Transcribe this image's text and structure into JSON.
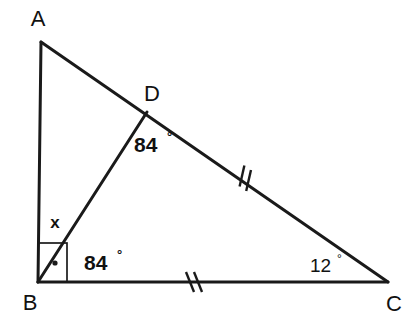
{
  "figure": {
    "type": "geometry-diagram",
    "shape": "triangle-with-cevian",
    "background_color": "#ffffff",
    "stroke_color": "#1a1a1a",
    "vertices": [
      {
        "id": "A",
        "label": "A",
        "x": 41,
        "y": 42,
        "label_x": 38,
        "label_y": 26
      },
      {
        "id": "B",
        "label": "B",
        "x": 38,
        "y": 282,
        "label_x": 30,
        "label_y": 302
      },
      {
        "id": "C",
        "label": "C",
        "x": 388,
        "y": 282,
        "label_x": 392,
        "label_y": 303
      },
      {
        "id": "D",
        "label": "D",
        "x": 147,
        "y": 112,
        "label_x": 152,
        "label_y": 94
      }
    ],
    "segments": [
      {
        "id": "AB",
        "from": "A",
        "to": "B",
        "x1": 41,
        "y1": 42,
        "x2": 38,
        "y2": 282
      },
      {
        "id": "AC",
        "from": "A",
        "to": "C",
        "x1": 41,
        "y1": 42,
        "x2": 388,
        "y2": 282
      },
      {
        "id": "BC",
        "from": "B",
        "to": "C",
        "x1": 38,
        "y1": 282,
        "x2": 388,
        "y2": 282
      },
      {
        "id": "BD",
        "from": "B",
        "to": "D",
        "x1": 38,
        "y1": 282,
        "x2": 147,
        "y2": 112
      }
    ],
    "angles": [
      {
        "id": "angle-at-D",
        "value": "84",
        "degree_symbol": "°",
        "vertex": "D",
        "label_x": 134,
        "label_y": 152,
        "weight": "bold"
      },
      {
        "id": "angle-DBC",
        "value": "84",
        "degree_symbol": "°",
        "vertex": "B",
        "label_x": 84,
        "label_y": 270,
        "weight": "bold"
      },
      {
        "id": "angle-at-C",
        "value": "12",
        "degree_symbol": "°",
        "vertex": "C",
        "label_x": 310,
        "label_y": 272,
        "weight": "plain"
      }
    ],
    "unknown_angle": {
      "id": "angle-ABD",
      "label": "x",
      "label_x": 55,
      "label_y": 228
    },
    "right_angle": {
      "id": "right-angle-at-B",
      "vertex": "B",
      "box": {
        "x": 38,
        "y": 243,
        "width": 29,
        "height": 39
      },
      "dot": {
        "cx": 55,
        "cy": 263,
        "r": 2.6
      }
    },
    "congruence_ticks": [
      {
        "id": "tick-DC",
        "on_segment": "DC",
        "count": 2,
        "center_x": 242,
        "center_y": 176,
        "rotation_deg": 34.6
      },
      {
        "id": "tick-BC",
        "on_segment": "BC",
        "count": 2,
        "center_x": 190,
        "center_y": 282,
        "rotation_deg": 0
      }
    ]
  }
}
